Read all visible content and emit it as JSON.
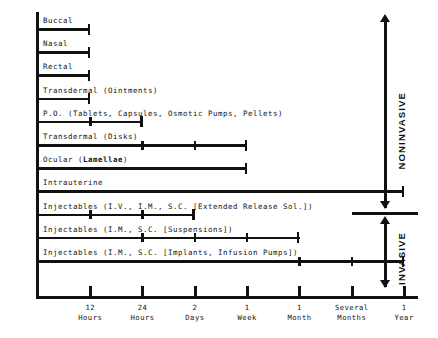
{
  "chart_data": {
    "type": "bar",
    "orientation": "horizontal",
    "title": "",
    "xlabel": "",
    "ylabel": "",
    "grid": false,
    "axis_ticks": [
      {
        "label_line1": "12",
        "label_line2": "Hours",
        "pos": 1
      },
      {
        "label_line1": "24",
        "label_line2": "Hours",
        "pos": 2
      },
      {
        "label_line1": "2",
        "label_line2": "Days",
        "pos": 3
      },
      {
        "label_line1": "1",
        "label_line2": "Week",
        "pos": 4
      },
      {
        "label_line1": "1",
        "label_line2": "Month",
        "pos": 5
      },
      {
        "label_line1": "Several",
        "label_line2": "Months",
        "pos": 6
      },
      {
        "label_line1": "1",
        "label_line2": "Year",
        "pos": 7
      }
    ],
    "categories": [
      "Buccal",
      "Nasal",
      "Rectal",
      "Transdermal (Ointments)",
      "P.O. (Tablets, Capsules, Osmotic Pumps, Pellets)",
      "Transdermal (Disks)",
      "Ocular (Lamellae)",
      "Intrauterine",
      "Injectables (I.V., I.M., S.C. [Extended Release Sol.])",
      "Injectables (I.M., S.C. [Suspensions])",
      "Injectables (I.M., S.C. [Implants, Infusion Pumps])"
    ],
    "bars": [
      {
        "label": "Buccal",
        "label_bold": "",
        "end": 1,
        "ticks": [],
        "group": "noninvasive"
      },
      {
        "label": "Nasal",
        "label_bold": "",
        "end": 1,
        "ticks": [],
        "group": "noninvasive"
      },
      {
        "label": "Rectal",
        "label_bold": "",
        "end": 1,
        "ticks": [],
        "group": "noninvasive"
      },
      {
        "label": "Transdermal (Ointments)",
        "label_bold": "",
        "end": 1,
        "ticks": [],
        "group": "noninvasive"
      },
      {
        "label": "P.O. (Tablets, Capsules, Osmotic Pumps, Pellets)",
        "label_bold": "",
        "end": 2,
        "ticks": [
          1
        ],
        "group": "noninvasive"
      },
      {
        "label": "Transdermal (Disks)",
        "label_bold": "",
        "end": 4,
        "ticks": [
          2,
          3
        ],
        "group": "noninvasive"
      },
      {
        "label": "Ocular (",
        "label_bold": "Lamellae",
        "label_tail": ")",
        "end": 4,
        "ticks": [],
        "group": "noninvasive"
      },
      {
        "label": "Intrauterine",
        "label_bold": "",
        "end": 7,
        "ticks": [],
        "group": "noninvasive"
      },
      {
        "label": "Injectables (I.V., I.M., S.C. [Extended Release Sol.])",
        "label_bold": "",
        "end": 3,
        "ticks": [
          1,
          2
        ],
        "group": "invasive"
      },
      {
        "label": "Injectables (I.M., S.C. [Suspensions])",
        "label_bold": "",
        "end": 5,
        "ticks": [
          2,
          3,
          4
        ],
        "group": "invasive"
      },
      {
        "label": "Injectables (I.M., S.C. [Implants, Infusion Pumps])",
        "label_bold": "",
        "end": 7,
        "ticks": [
          5,
          6
        ],
        "group": "invasive"
      }
    ],
    "annotations": [
      {
        "text": "NONINVASIVE",
        "side": "right",
        "section": "top"
      },
      {
        "text": "INVASIVE",
        "side": "right",
        "section": "bottom"
      }
    ],
    "legend": [],
    "colors": {
      "bar": "#111111",
      "axis": "#111111",
      "background": "#ffffff"
    }
  },
  "labels": {
    "noninvasive": "NONINVASIVE",
    "invasive": "INVASIVE"
  }
}
